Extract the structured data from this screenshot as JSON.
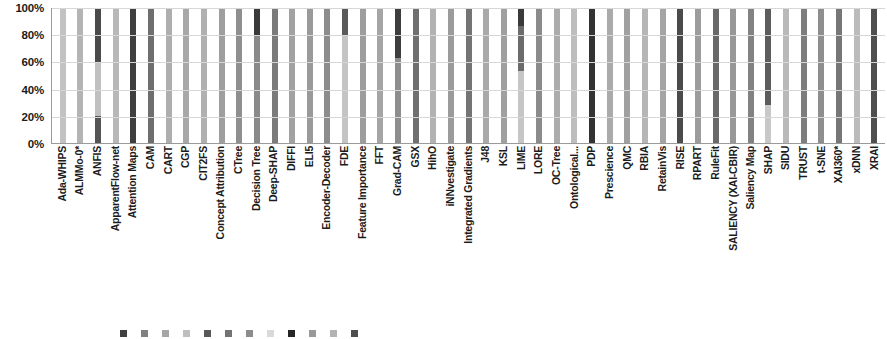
{
  "chart_data": {
    "type": "bar",
    "title": "",
    "subtitle": "",
    "xlabel": "",
    "ylabel": "",
    "ylim": [
      0,
      100
    ],
    "grid": true,
    "stacked": true,
    "stack_mode": "100% stacked",
    "legend_position": "bottom",
    "legend_truncated": true,
    "y_ticks": [
      "0%",
      "20%",
      "40%",
      "60%",
      "80%",
      "100%"
    ],
    "y_tick_values": [
      0,
      20,
      40,
      60,
      80,
      100
    ],
    "categories": [
      "Ada-WHIPS",
      "ALMMo-0*",
      "ANFIS",
      "ApparentFlow-net",
      "Attention Maps",
      "CAM",
      "CART",
      "CGP",
      "CIT2FS",
      "Concept Attribution",
      "CTree",
      "Decision Tree",
      "Deep-SHAP",
      "DIFFI",
      "ELI5",
      "Encoder-Decoder",
      "FDE",
      "Feature Importance",
      "FFT",
      "Grad-CAM",
      "GSX",
      "HihO",
      "iNNvestigate",
      "Integrated Gradients",
      "J48",
      "KSL",
      "LIME",
      "LORE",
      "OC-Tree",
      "Ontological...",
      "PDP",
      "Prescience",
      "QMC",
      "RBIA",
      "RetainVis",
      "RISE",
      "RPART",
      "RuleFit",
      "SALIENCY (XAI-CBIR)",
      "Saliency Map",
      "SHAP",
      "SIDU",
      "TRUST",
      "t-SNE",
      "XAI360*",
      "xDNN",
      "XRAI"
    ],
    "legend_entries": [
      {
        "label": "",
        "color": "#404040"
      },
      {
        "label": "",
        "color": "#808080"
      },
      {
        "label": "",
        "color": "#a6a6a6"
      },
      {
        "label": "",
        "color": "#bfbfbf"
      },
      {
        "label": "",
        "color": "#595959"
      },
      {
        "label": "",
        "color": "#737373"
      },
      {
        "label": "",
        "color": "#8c8c8c"
      },
      {
        "label": "",
        "color": "#d9d9d9"
      },
      {
        "label": "",
        "color": "#262626"
      },
      {
        "label": "",
        "color": "#999999"
      },
      {
        "label": "",
        "color": "#b3b3b3"
      },
      {
        "label": "",
        "color": "#4d4d4d"
      }
    ],
    "bars": [
      {
        "category": "Ada-WHIPS",
        "segments": [
          {
            "value": 100,
            "color": "#c2c2c2"
          }
        ]
      },
      {
        "category": "ALMMo-0*",
        "segments": [
          {
            "value": 100,
            "color": "#b4b4b4"
          }
        ]
      },
      {
        "category": "ANFIS",
        "segments": [
          {
            "value": 40,
            "color": "#4a4a4a"
          },
          {
            "value": 40,
            "color": "#c0c0c0"
          },
          {
            "value": 20,
            "color": "#555555"
          }
        ]
      },
      {
        "category": "ApparentFlow-net",
        "segments": [
          {
            "value": 100,
            "color": "#b8b8b8"
          }
        ]
      },
      {
        "category": "Attention Maps",
        "segments": [
          {
            "value": 100,
            "color": "#3f3f3f"
          }
        ]
      },
      {
        "category": "CAM",
        "segments": [
          {
            "value": 100,
            "color": "#6e6e6e"
          }
        ]
      },
      {
        "category": "CART",
        "segments": [
          {
            "value": 100,
            "color": "#aeaeae"
          }
        ]
      },
      {
        "category": "CGP",
        "segments": [
          {
            "value": 100,
            "color": "#a8a8a8"
          }
        ]
      },
      {
        "category": "CIT2FS",
        "segments": [
          {
            "value": 100,
            "color": "#b0b0b0"
          }
        ]
      },
      {
        "category": "Concept Attribution",
        "segments": [
          {
            "value": 100,
            "color": "#9e9e9e"
          }
        ]
      },
      {
        "category": "CTree",
        "segments": [
          {
            "value": 100,
            "color": "#8f8f8f"
          }
        ]
      },
      {
        "category": "Decision Tree",
        "segments": [
          {
            "value": 20,
            "color": "#3a3a3a"
          },
          {
            "value": 80,
            "color": "#8a8a8a"
          }
        ]
      },
      {
        "category": "Deep-SHAP",
        "segments": [
          {
            "value": 100,
            "color": "#7b7b7b"
          }
        ]
      },
      {
        "category": "DIFFI",
        "segments": [
          {
            "value": 100,
            "color": "#a2a2a2"
          }
        ]
      },
      {
        "category": "ELI5",
        "segments": [
          {
            "value": 100,
            "color": "#9a9a9a"
          }
        ]
      },
      {
        "category": "Encoder-Decoder",
        "segments": [
          {
            "value": 100,
            "color": "#8c8c8c"
          }
        ]
      },
      {
        "category": "FDE",
        "segments": [
          {
            "value": 20,
            "color": "#5a5a5a"
          },
          {
            "value": 80,
            "color": "#c4c4c4"
          }
        ]
      },
      {
        "category": "Feature Importance",
        "segments": [
          {
            "value": 100,
            "color": "#9d9d9d"
          }
        ]
      },
      {
        "category": "FFT",
        "segments": [
          {
            "value": 100,
            "color": "#a5a5a5"
          }
        ]
      },
      {
        "category": "Grad-CAM",
        "segments": [
          {
            "value": 37,
            "color": "#3d3d3d"
          },
          {
            "value": 63,
            "color": "#8d8d8d"
          }
        ]
      },
      {
        "category": "GSX",
        "segments": [
          {
            "value": 100,
            "color": "#707070"
          }
        ]
      },
      {
        "category": "HihO",
        "segments": [
          {
            "value": 100,
            "color": "#b2b2b2"
          }
        ]
      },
      {
        "category": "iNNvestigate",
        "segments": [
          {
            "value": 100,
            "color": "#9b9b9b"
          }
        ]
      },
      {
        "category": "Integrated Gradients",
        "segments": [
          {
            "value": 100,
            "color": "#747474"
          }
        ]
      },
      {
        "category": "J48",
        "segments": [
          {
            "value": 100,
            "color": "#a9a9a9"
          }
        ]
      },
      {
        "category": "KSL",
        "segments": [
          {
            "value": 100,
            "color": "#9f9f9f"
          }
        ]
      },
      {
        "category": "LIME",
        "segments": [
          {
            "value": 13,
            "color": "#3a3a3a"
          },
          {
            "value": 34,
            "color": "#6b6b6b"
          },
          {
            "value": 53,
            "color": "#c6c6c6"
          }
        ]
      },
      {
        "category": "LORE",
        "segments": [
          {
            "value": 100,
            "color": "#8b8b8b"
          }
        ]
      },
      {
        "category": "OC-Tree",
        "segments": [
          {
            "value": 100,
            "color": "#acacac"
          }
        ]
      },
      {
        "category": "Ontological...",
        "segments": [
          {
            "value": 100,
            "color": "#bdbdbd"
          }
        ]
      },
      {
        "category": "PDP",
        "segments": [
          {
            "value": 100,
            "color": "#333333"
          }
        ]
      },
      {
        "category": "Prescience",
        "segments": [
          {
            "value": 100,
            "color": "#aaaaaa"
          }
        ]
      },
      {
        "category": "QMC",
        "segments": [
          {
            "value": 100,
            "color": "#a0a0a0"
          }
        ]
      },
      {
        "category": "RBIA",
        "segments": [
          {
            "value": 100,
            "color": "#b6b6b6"
          }
        ]
      },
      {
        "category": "RetainVis",
        "segments": [
          {
            "value": 100,
            "color": "#a4a4a4"
          }
        ]
      },
      {
        "category": "RISE",
        "segments": [
          {
            "value": 100,
            "color": "#4b4b4b"
          }
        ]
      },
      {
        "category": "RPART",
        "segments": [
          {
            "value": 100,
            "color": "#9c9c9c"
          }
        ]
      },
      {
        "category": "RuleFit",
        "segments": [
          {
            "value": 100,
            "color": "#696969"
          }
        ]
      },
      {
        "category": "SALIENCY (XAI-CBIR)",
        "segments": [
          {
            "value": 100,
            "color": "#989898"
          }
        ]
      },
      {
        "category": "Saliency Map",
        "segments": [
          {
            "value": 100,
            "color": "#828282"
          }
        ]
      },
      {
        "category": "SHAP",
        "segments": [
          {
            "value": 72,
            "color": "#5c5c5c"
          },
          {
            "value": 28,
            "color": "#c8c8c8"
          }
        ]
      },
      {
        "category": "SIDU",
        "segments": [
          {
            "value": 100,
            "color": "#b9b9b9"
          }
        ]
      },
      {
        "category": "TRUST",
        "segments": [
          {
            "value": 100,
            "color": "#7d7d7d"
          }
        ]
      },
      {
        "category": "t-SNE",
        "segments": [
          {
            "value": 100,
            "color": "#8e8e8e"
          }
        ]
      },
      {
        "category": "XAI360*",
        "segments": [
          {
            "value": 100,
            "color": "#767676"
          }
        ]
      },
      {
        "category": "xDNN",
        "segments": [
          {
            "value": 100,
            "color": "#bbbbbb"
          }
        ]
      },
      {
        "category": "XRAI",
        "segments": [
          {
            "value": 100,
            "color": "#4f4f4f"
          }
        ]
      }
    ]
  }
}
